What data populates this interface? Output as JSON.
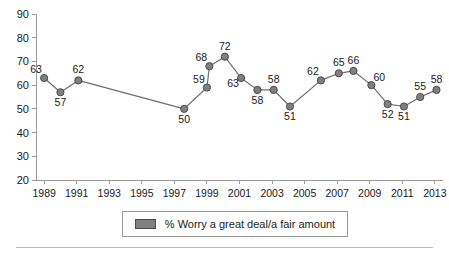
{
  "chart_data": {
    "type": "line",
    "title": "",
    "subtitle": "",
    "xlabel": "",
    "ylabel": "",
    "xlim": [
      1988.5,
      2013.5
    ],
    "ylim": [
      20,
      90
    ],
    "ytick_step": 10,
    "xtick_step": 2,
    "grid": false,
    "legend_position": "bottom",
    "ytick_labels": [
      "90",
      "80",
      "70",
      "60",
      "50",
      "40",
      "30",
      "20"
    ],
    "ytick_values": [
      90,
      80,
      70,
      60,
      50,
      40,
      30,
      20
    ],
    "xtick_labels": [
      "1989",
      "1991",
      "1993",
      "1995",
      "1997",
      "1999",
      "2001",
      "2003",
      "2005",
      "2007",
      "2009",
      "2011",
      "2013"
    ],
    "xtick_values": [
      1989,
      1991,
      1993,
      1995,
      1997,
      1999,
      2001,
      2003,
      2005,
      2007,
      2009,
      2011,
      2013
    ],
    "series": [
      {
        "name": "% Worry a great deal/a fair amount",
        "color": "#808080",
        "line_color": "#6e6e6e",
        "marker": "circle",
        "points": [
          {
            "x": 1989.0,
            "y": 63,
            "label": "63",
            "label_pos": "above-left"
          },
          {
            "x": 1990.0,
            "y": 57,
            "label": "57",
            "label_pos": "below"
          },
          {
            "x": 1991.1,
            "y": 62,
            "label": "62",
            "label_pos": "above"
          },
          {
            "x": 1997.6,
            "y": 50,
            "label": "50",
            "label_pos": "below"
          },
          {
            "x": 1999.0,
            "y": 59,
            "label": "59",
            "label_pos": "above-left"
          },
          {
            "x": 1999.15,
            "y": 68,
            "label": "68",
            "label_pos": "above-left"
          },
          {
            "x": 2000.1,
            "y": 72,
            "label": "72",
            "label_pos": "above"
          },
          {
            "x": 2001.1,
            "y": 63,
            "label": "63",
            "label_pos": "below-left"
          },
          {
            "x": 2002.1,
            "y": 58,
            "label": "58",
            "label_pos": "below"
          },
          {
            "x": 2003.1,
            "y": 58,
            "label": "58",
            "label_pos": "above"
          },
          {
            "x": 2004.1,
            "y": 51,
            "label": "51",
            "label_pos": "below"
          },
          {
            "x": 2006.0,
            "y": 62,
            "label": "62",
            "label_pos": "above-left"
          },
          {
            "x": 2007.1,
            "y": 65,
            "label": "65",
            "label_pos": "above"
          },
          {
            "x": 2008.0,
            "y": 66,
            "label": "66",
            "label_pos": "above"
          },
          {
            "x": 2009.1,
            "y": 60,
            "label": "60",
            "label_pos": "above-right"
          },
          {
            "x": 2010.1,
            "y": 52,
            "label": "52",
            "label_pos": "below"
          },
          {
            "x": 2011.1,
            "y": 51,
            "label": "51",
            "label_pos": "below"
          },
          {
            "x": 2012.1,
            "y": 55,
            "label": "55",
            "label_pos": "above"
          },
          {
            "x": 2013.1,
            "y": 58,
            "label": "58",
            "label_pos": "above"
          }
        ]
      }
    ]
  },
  "legend": {
    "entries": [
      {
        "label": "% Worry a great deal/a fair amount",
        "swatch_color": "#808080"
      }
    ]
  },
  "colors": {
    "marker_fill": "#808080",
    "marker_stroke": "#4a4a4a",
    "line": "#6e6e6e",
    "axis": "#9a9a9a",
    "text": "#1a1a1a",
    "background": "#ffffff"
  }
}
